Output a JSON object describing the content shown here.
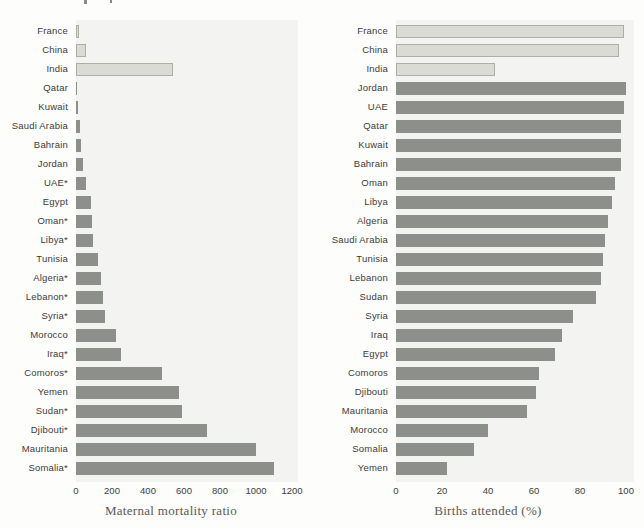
{
  "figure": {
    "left_title": "Maternal mortality ratio",
    "right_title": "Births attended (%)"
  },
  "colors": {
    "plot_background": "#f3f3f1",
    "bar_dark": "#8d908a",
    "bar_light": "#dadbd5",
    "bar_light_border": "#adafa7",
    "label_text": "#3c3c3c",
    "title_text": "#5a5955"
  },
  "chart_data": [
    {
      "type": "bar",
      "orientation": "horizontal",
      "xlabel": "Maternal mortality ratio",
      "xlim": [
        0,
        1200
      ],
      "xticks": [
        0,
        200,
        400,
        600,
        800,
        1000,
        1200
      ],
      "grid": false,
      "legend": "none",
      "categories": [
        "France",
        "China",
        "India",
        "Qatar",
        "Kuwait",
        "Saudi Arabia",
        "Bahrain",
        "Jordan",
        "UAE*",
        "Egypt",
        "Oman*",
        "Libya*",
        "Tunisia",
        "Algeria*",
        "Lebanon*",
        "Syria*",
        "Morocco",
        "Iraq*",
        "Comoros*",
        "Yemen",
        "Sudan*",
        "Djibouti*",
        "Mauritania",
        "Somalia*"
      ],
      "values": [
        17,
        56,
        540,
        7,
        10,
        23,
        28,
        41,
        54,
        84,
        87,
        97,
        120,
        140,
        150,
        160,
        220,
        250,
        480,
        570,
        590,
        730,
        1000,
        1100
      ],
      "light_bar_indexes": [
        0,
        1,
        2
      ]
    },
    {
      "type": "bar",
      "orientation": "horizontal",
      "xlabel": "Births attended (%)",
      "xlim": [
        0,
        100
      ],
      "xticks": [
        0,
        20,
        40,
        60,
        80,
        100
      ],
      "grid": false,
      "legend": "none",
      "categories": [
        "France",
        "China",
        "India",
        "Jordan",
        "UAE",
        "Qatar",
        "Kuwait",
        "Bahrain",
        "Oman",
        "Libya",
        "Algeria",
        "Saudi Arabia",
        "Tunisia",
        "Lebanon",
        "Sudan",
        "Syria",
        "Iraq",
        "Egypt",
        "Comoros",
        "Djibouti",
        "Mauritania",
        "Morocco",
        "Somalia",
        "Yemen"
      ],
      "values": [
        99,
        97,
        43,
        100,
        99,
        98,
        98,
        98,
        95,
        94,
        92,
        91,
        90,
        89,
        87,
        77,
        72,
        69,
        62,
        61,
        57,
        40,
        34,
        22
      ],
      "light_bar_indexes": [
        0,
        1,
        2
      ]
    }
  ]
}
